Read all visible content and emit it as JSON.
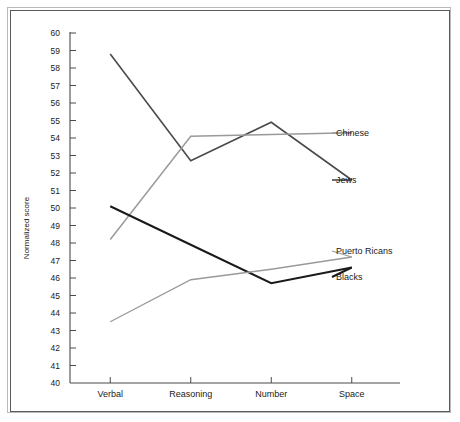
{
  "chart_data": {
    "type": "line",
    "title": "",
    "xlabel": "",
    "ylabel": "Normalized score",
    "categories": [
      "Verbal",
      "Reasoning",
      "Number",
      "Space"
    ],
    "ylim": [
      40,
      60
    ],
    "ytick_step": 1,
    "yticks": [
      40,
      41,
      42,
      43,
      44,
      45,
      46,
      47,
      48,
      49,
      50,
      51,
      52,
      53,
      54,
      55,
      56,
      57,
      58,
      59,
      60
    ],
    "grid": false,
    "legend_position": "right-inline-labels",
    "series": [
      {
        "name": "Jews",
        "color": "#4a4a4a",
        "stroke_width": 1.6,
        "label_anchor": "Space",
        "values": [
          58.8,
          52.7,
          54.9,
          51.6
        ]
      },
      {
        "name": "Chinese",
        "color": "#9a9a9a",
        "stroke_width": 1.5,
        "label_anchor": "Space",
        "values": [
          48.2,
          54.1,
          54.2,
          54.3
        ]
      },
      {
        "name": "Blacks",
        "color": "#1a1a1a",
        "stroke_width": 2.0,
        "label_anchor": "Space",
        "values": [
          50.1,
          47.9,
          45.7,
          46.6
        ]
      },
      {
        "name": "Puerto Ricans",
        "color": "#9a9a9a",
        "stroke_width": 1.3,
        "label_anchor": "Space",
        "values": [
          43.5,
          45.9,
          46.5,
          47.2
        ]
      }
    ]
  },
  "axis": {
    "y_title": "Normalized score"
  }
}
